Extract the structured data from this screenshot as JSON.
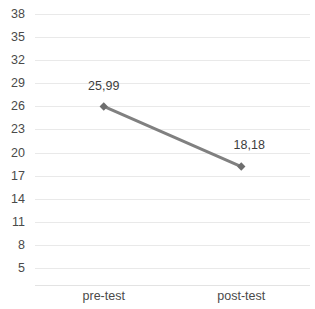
{
  "chart_data": {
    "type": "line",
    "title": "",
    "subtitle": "",
    "xlabel": "",
    "ylabel": "",
    "categories": [
      "pre-test",
      "post-test"
    ],
    "values": [
      25.99,
      18.18
    ],
    "point_labels": [
      "25,99",
      "18,18"
    ],
    "series": [
      {
        "name": "",
        "values": [
          25.99,
          18.18
        ],
        "color": "#808080",
        "marker": "diamond",
        "line_width": 3
      }
    ],
    "ylim": [
      5,
      38
    ],
    "ytick_step": 3,
    "yticks": [
      38,
      35,
      32,
      29,
      26,
      23,
      20,
      17,
      14,
      11,
      8,
      5
    ],
    "ytick_labels": [
      "38",
      "35",
      "32",
      "29",
      "26",
      "23",
      "20",
      "17",
      "14",
      "11",
      "8",
      "5"
    ],
    "grid": true,
    "grid_axis": "y",
    "legend": false,
    "legend_position": "none",
    "colors": {
      "background": "#ffffff",
      "gridline": "#e9e9e9",
      "axis_line": "#e3e3e3",
      "tick_text": "#4a4a4a",
      "label_text": "#3d3d3d",
      "series_line": "#808080",
      "marker": "#6e6e6e"
    }
  }
}
